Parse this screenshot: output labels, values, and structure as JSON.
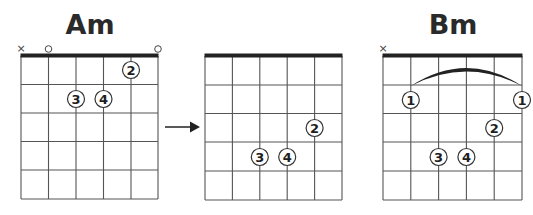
{
  "diagram": {
    "type": "guitar-chord-transition",
    "colors": {
      "line": "#555555",
      "nut": "#222222",
      "ink": "#1e1e1e",
      "background": "#ffffff"
    },
    "arrow": {
      "direction": "right",
      "from": "chord_1",
      "to": "chord_2"
    },
    "chords": [
      {
        "id": "chord_1",
        "name": "Am",
        "string_markers": [
          "x",
          "o",
          "",
          "",
          "",
          "o"
        ],
        "barre": null,
        "fingers": [
          {
            "label": "2",
            "string": 5,
            "fret": 1
          },
          {
            "label": "3",
            "string": 3,
            "fret": 2
          },
          {
            "label": "4",
            "string": 4,
            "fret": 2
          }
        ]
      },
      {
        "id": "chord_2",
        "name": "",
        "string_markers": [
          "",
          "",
          "",
          "",
          "",
          ""
        ],
        "barre": null,
        "fingers": [
          {
            "label": "2",
            "string": 5,
            "fret": 3
          },
          {
            "label": "3",
            "string": 3,
            "fret": 4
          },
          {
            "label": "4",
            "string": 4,
            "fret": 4
          }
        ]
      },
      {
        "id": "chord_3",
        "name": "Bm",
        "string_markers": [
          "x",
          "",
          "",
          "",
          "",
          ""
        ],
        "barre": {
          "fret": 2,
          "from_string": 2,
          "to_string": 6,
          "finger": "1"
        },
        "fingers": [
          {
            "label": "1",
            "string": 2,
            "fret": 2
          },
          {
            "label": "1",
            "string": 6,
            "fret": 2
          },
          {
            "label": "2",
            "string": 5,
            "fret": 3
          },
          {
            "label": "3",
            "string": 3,
            "fret": 4
          },
          {
            "label": "4",
            "string": 4,
            "fret": 4
          }
        ]
      }
    ],
    "labels": {
      "chord_1_title": "Am",
      "chord_3_title": "Bm",
      "f_1_2": "2",
      "f_1_3": "3",
      "f_1_4": "4",
      "f_2_2": "2",
      "f_2_3": "3",
      "f_2_4": "4",
      "f_3_1a": "1",
      "f_3_1b": "1",
      "f_3_2": "2",
      "f_3_3": "3",
      "f_3_4": "4",
      "mute": "×"
    }
  }
}
